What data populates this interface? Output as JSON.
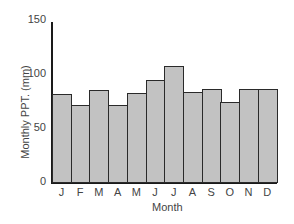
{
  "chart_data": {
    "type": "bar",
    "title": "",
    "xlabel": "Month",
    "ylabel": "Monthly PPT. (mm)",
    "categories": [
      "J",
      "F",
      "M",
      "A",
      "M",
      "J",
      "J",
      "A",
      "S",
      "O",
      "N",
      "D"
    ],
    "values": [
      82,
      72,
      86,
      72,
      83,
      95,
      108,
      84,
      87,
      75,
      87,
      87
    ],
    "ylim": [
      0,
      150
    ],
    "yticks": [
      0,
      50,
      100,
      150
    ],
    "grid": false,
    "legend": null,
    "bar_color": "#c2c2c2",
    "edge_color": "#2a2a2a"
  }
}
